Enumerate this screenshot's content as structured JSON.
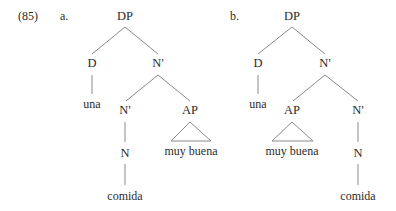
{
  "example_number": "(85)",
  "trees": [
    {
      "label": "a.",
      "root": "DP",
      "nodes": {
        "dp": "DP",
        "d": "D",
        "d_word": "una",
        "nbar_top": "N'",
        "nbar_low": "N'",
        "ap": "AP",
        "ap_word": "muy buena",
        "n": "N",
        "n_word": "comida"
      }
    },
    {
      "label": "b.",
      "root": "DP",
      "nodes": {
        "dp": "DP",
        "d": "D",
        "d_word": "una",
        "nbar_top": "N'",
        "nbar_low": "N'",
        "ap": "AP",
        "ap_word": "muy buena",
        "n": "N",
        "n_word": "comida"
      }
    }
  ]
}
